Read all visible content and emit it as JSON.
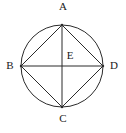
{
  "figure": {
    "background_color": "#ffffff",
    "stroke_color": "#2b2b2b",
    "label_color": "#1a1a1a",
    "stroke_width": 1,
    "circle": {
      "center_x": 62,
      "center_y": 66,
      "radius": 41
    },
    "points": {
      "a": {
        "label": "A",
        "x": 62,
        "y": 25,
        "position": "top"
      },
      "b": {
        "label": "B",
        "x": 21,
        "y": 66,
        "position": "left"
      },
      "c": {
        "label": "C",
        "x": 62,
        "y": 107,
        "position": "bottom"
      },
      "d": {
        "label": "D",
        "x": 103,
        "y": 66,
        "position": "right"
      },
      "e": {
        "label": "E",
        "x": 62,
        "y": 66,
        "position": "center"
      }
    },
    "segments": [
      {
        "name": "diameter-bd",
        "from": "B",
        "to": "D"
      },
      {
        "name": "diameter-ac",
        "from": "A",
        "to": "C"
      },
      {
        "name": "chord-ab",
        "from": "A",
        "to": "B"
      },
      {
        "name": "chord-ad",
        "from": "A",
        "to": "D"
      },
      {
        "name": "chord-bc",
        "from": "B",
        "to": "C"
      },
      {
        "name": "chord-cd",
        "from": "C",
        "to": "D"
      }
    ]
  }
}
